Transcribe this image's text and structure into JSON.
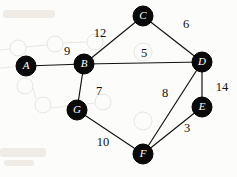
{
  "diagram": {
    "type": "undirected-weighted-graph",
    "canvas": {
      "width": 237,
      "height": 177,
      "paper_color": "#fcfcfa"
    },
    "node_style": {
      "fill": "#0a0a0a",
      "radius": 10,
      "label_color": "#ffffff"
    },
    "edge_style": {
      "color": "#141414"
    },
    "nodes": [
      {
        "id": "A",
        "label": "A",
        "x": 26,
        "y": 66
      },
      {
        "id": "B",
        "label": "B",
        "x": 84,
        "y": 64
      },
      {
        "id": "C",
        "label": "C",
        "x": 143,
        "y": 16
      },
      {
        "id": "D",
        "label": "D",
        "x": 202,
        "y": 62
      },
      {
        "id": "E",
        "label": "E",
        "x": 202,
        "y": 107
      },
      {
        "id": "F",
        "label": "F",
        "x": 143,
        "y": 154
      },
      {
        "id": "G",
        "label": "G",
        "x": 77,
        "y": 110
      }
    ],
    "edges": [
      {
        "from": "A",
        "to": "B",
        "weight": "9",
        "label_x": 67,
        "label_y": 52
      },
      {
        "from": "B",
        "to": "C",
        "weight": "12",
        "label_x": 100,
        "label_y": 34
      },
      {
        "from": "C",
        "to": "D",
        "weight": "6",
        "label_x": 186,
        "label_y": 25
      },
      {
        "from": "B",
        "to": "D",
        "weight": "5",
        "label_x": 144,
        "label_y": 54
      },
      {
        "from": "B",
        "to": "G",
        "weight": "7",
        "label_x": 99,
        "label_y": 92
      },
      {
        "from": "G",
        "to": "F",
        "weight": "10",
        "label_x": 103,
        "label_y": 143
      },
      {
        "from": "D",
        "to": "F",
        "weight": "8",
        "label_x": 165,
        "label_y": 94
      },
      {
        "from": "D",
        "to": "E",
        "weight": "14",
        "label_x": 222,
        "label_y": 88
      },
      {
        "from": "E",
        "to": "F",
        "weight": "3",
        "label_x": 187,
        "label_y": 129
      }
    ],
    "bleed_through": {
      "circles": [
        {
          "x": 18,
          "y": 48,
          "r": 8
        },
        {
          "x": 55,
          "y": 44,
          "r": 8
        },
        {
          "x": 95,
          "y": 42,
          "r": 8
        },
        {
          "x": 143,
          "y": 52,
          "r": 9
        },
        {
          "x": 25,
          "y": 86,
          "r": 8
        },
        {
          "x": 43,
          "y": 105,
          "r": 8
        },
        {
          "x": 103,
          "y": 102,
          "r": 8
        },
        {
          "x": 143,
          "y": 121,
          "r": 9
        }
      ],
      "lines": [
        {
          "x1": 0,
          "y1": 50,
          "x2": 10,
          "y2": 49
        },
        {
          "x1": 26,
          "y1": 47,
          "x2": 47,
          "y2": 45
        },
        {
          "x1": 63,
          "y1": 43,
          "x2": 87,
          "y2": 42
        },
        {
          "x1": 0,
          "y1": 68,
          "x2": 14,
          "y2": 67
        },
        {
          "x1": 33,
          "y1": 88,
          "x2": 36,
          "y2": 99
        },
        {
          "x1": 51,
          "y1": 108,
          "x2": 95,
          "y2": 103
        }
      ],
      "smudges": [
        {
          "x": 3,
          "y": 10,
          "w": 52,
          "h": 8
        },
        {
          "x": 0,
          "y": 148,
          "w": 46,
          "h": 9
        },
        {
          "x": 4,
          "y": 160,
          "w": 30,
          "h": 6
        }
      ]
    }
  }
}
